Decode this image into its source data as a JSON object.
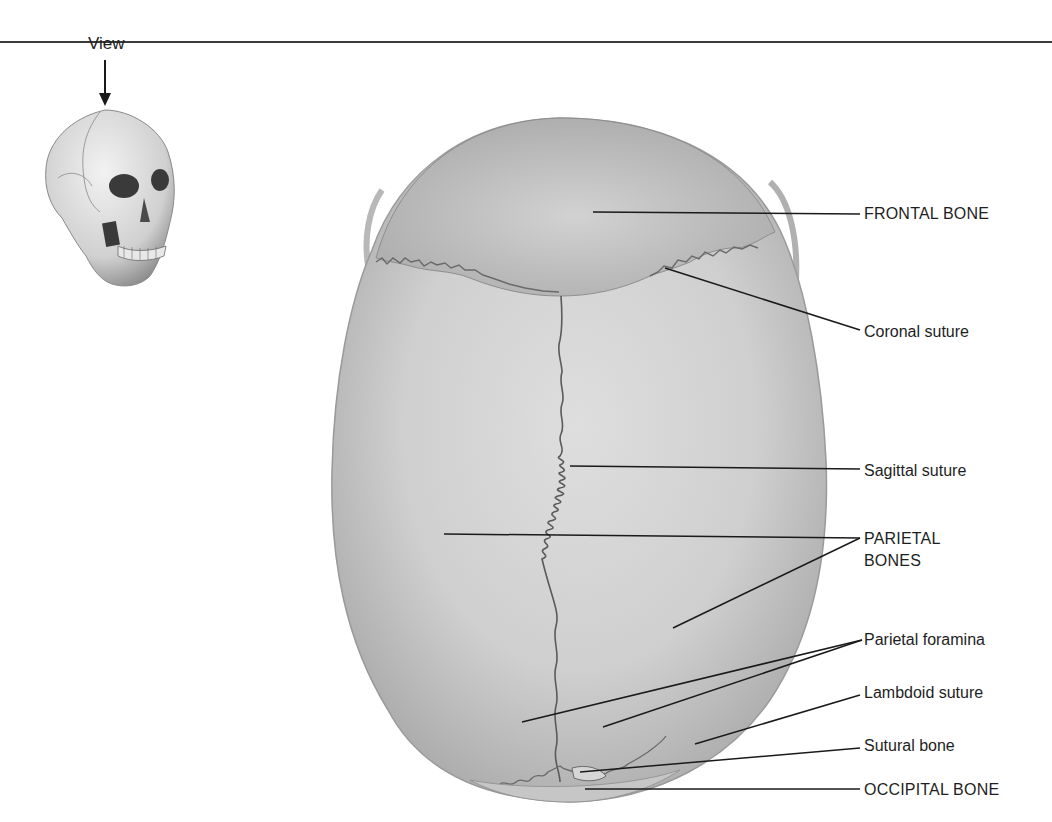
{
  "figure": {
    "view_indicator": {
      "label": "View",
      "icon": "arrow-down-icon"
    },
    "thumbnail": {
      "icon": "skull-three-quarter-icon",
      "description": "Small skull in anterolateral view indicating superior viewing direction"
    },
    "main_image": {
      "description": "Skull, superior view"
    },
    "colors": {
      "line": "#1a1a1a",
      "bone_light": "#d9d9d9",
      "bone_mid": "#c4c4c4",
      "bone_dark": "#a8a8a8",
      "suture": "#5a5a5a",
      "rule": "#3a3a3a"
    }
  },
  "labels": [
    {
      "id": "frontal-bone",
      "text": "FRONTAL BONE"
    },
    {
      "id": "coronal-suture",
      "text": "Coronal suture"
    },
    {
      "id": "sagittal-suture",
      "text": "Sagittal suture"
    },
    {
      "id": "parietal-bones",
      "text": "PARIETAL",
      "text2": "BONES"
    },
    {
      "id": "parietal-foramina",
      "text": "Parietal foramina"
    },
    {
      "id": "lambdoid-suture",
      "text": "Lambdoid suture"
    },
    {
      "id": "sutural-bone",
      "text": "Sutural bone"
    },
    {
      "id": "occipital-bone",
      "text": "OCCIPITAL BONE"
    }
  ]
}
